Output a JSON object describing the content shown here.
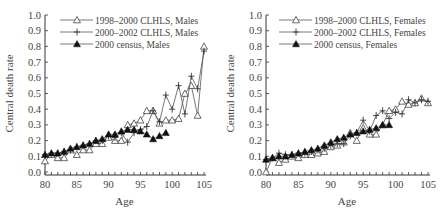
{
  "chart_data": [
    {
      "type": "line",
      "title": "",
      "xlabel": "Age",
      "ylabel": "Central death rate",
      "xlim": [
        80,
        105
      ],
      "ylim": [
        0.0,
        1.0
      ],
      "xticks": [
        "80",
        "85",
        "90",
        "95",
        "100",
        "105"
      ],
      "yticks": [
        "0.0",
        "0.1",
        "0.2",
        "0.3",
        "0.4",
        "0.5",
        "0.6",
        "0.7",
        "0.8",
        "0.9",
        "1.0"
      ],
      "legend_position": "top-left",
      "series": [
        {
          "name": "1998–2000 CLHLS, Males",
          "marker": "open-triangle",
          "x": [
            80,
            81,
            82,
            83,
            84,
            85,
            86,
            87,
            88,
            89,
            90,
            91,
            92,
            93,
            94,
            95,
            96,
            97,
            98,
            99,
            100,
            101,
            102,
            103,
            104,
            105
          ],
          "y": [
            0.07,
            0.11,
            0.09,
            0.09,
            0.14,
            0.11,
            0.14,
            0.14,
            0.18,
            0.18,
            0.22,
            0.2,
            0.2,
            0.3,
            0.31,
            0.33,
            0.39,
            0.39,
            0.31,
            0.33,
            0.33,
            0.34,
            0.5,
            0.55,
            0.36,
            0.8
          ]
        },
        {
          "name": "2000–2002 CLHLS, Males",
          "marker": "plus",
          "x": [
            80,
            81,
            82,
            83,
            84,
            85,
            86,
            87,
            88,
            89,
            90,
            91,
            92,
            93,
            94,
            95,
            96,
            97,
            98,
            99,
            100,
            101,
            102,
            103,
            104,
            105
          ],
          "y": [
            0.11,
            0.12,
            0.12,
            0.13,
            0.14,
            0.16,
            0.17,
            0.18,
            0.2,
            0.2,
            0.23,
            0.22,
            0.25,
            0.19,
            0.25,
            0.27,
            0.29,
            0.39,
            0.32,
            0.49,
            0.4,
            0.55,
            0.37,
            0.61,
            0.53,
            0.77
          ]
        },
        {
          "name": "2000 census, Males",
          "marker": "filled-triangle",
          "x": [
            80,
            81,
            82,
            83,
            84,
            85,
            86,
            87,
            88,
            89,
            90,
            91,
            92,
            93,
            94,
            95,
            96,
            97,
            98,
            99
          ],
          "y": [
            0.11,
            0.12,
            0.12,
            0.13,
            0.15,
            0.16,
            0.17,
            0.18,
            0.2,
            0.21,
            0.24,
            0.24,
            0.26,
            0.27,
            0.27,
            0.26,
            0.24,
            0.21,
            0.23,
            0.25
          ]
        }
      ]
    },
    {
      "type": "line",
      "title": "",
      "xlabel": "Age",
      "ylabel": "Central death rate",
      "xlim": [
        80,
        105
      ],
      "ylim": [
        0.0,
        1.0
      ],
      "xticks": [
        "80",
        "85",
        "90",
        "95",
        "100",
        "105"
      ],
      "yticks": [
        "0.0",
        "0.1",
        "0.2",
        "0.3",
        "0.4",
        "0.5",
        "0.6",
        "0.7",
        "0.8",
        "0.9",
        "1.0"
      ],
      "legend_position": "top-left",
      "series": [
        {
          "name": "1998–2000 CLHLS, Females",
          "marker": "open-triangle",
          "x": [
            80,
            81,
            82,
            83,
            84,
            85,
            86,
            87,
            88,
            89,
            90,
            91,
            92,
            93,
            94,
            95,
            96,
            97,
            98,
            99,
            100,
            101,
            102,
            103,
            104,
            105
          ],
          "y": [
            0.0,
            0.09,
            0.06,
            0.08,
            0.1,
            0.09,
            0.11,
            0.11,
            0.12,
            0.13,
            0.16,
            0.17,
            0.19,
            0.25,
            0.2,
            0.28,
            0.24,
            0.24,
            0.3,
            0.39,
            0.4,
            0.45,
            0.43,
            0.44,
            0.47,
            0.44
          ]
        },
        {
          "name": "2000–2002 CLHLS, Females",
          "marker": "plus",
          "x": [
            80,
            81,
            82,
            83,
            84,
            85,
            86,
            87,
            88,
            89,
            90,
            91,
            92,
            93,
            94,
            95,
            96,
            97,
            98,
            99,
            100,
            101,
            102,
            103,
            104,
            105
          ],
          "y": [
            0.08,
            0.09,
            0.12,
            0.11,
            0.11,
            0.12,
            0.12,
            0.13,
            0.14,
            0.15,
            0.17,
            0.18,
            0.18,
            0.23,
            0.25,
            0.33,
            0.26,
            0.36,
            0.39,
            0.34,
            0.38,
            0.37,
            0.46,
            0.44,
            0.46,
            0.45
          ]
        },
        {
          "name": "2000 census, Females",
          "marker": "filled-triangle",
          "x": [
            80,
            81,
            82,
            83,
            84,
            85,
            86,
            87,
            88,
            89,
            90,
            91,
            92,
            93,
            94,
            95,
            96,
            97,
            98,
            99
          ],
          "y": [
            0.08,
            0.09,
            0.1,
            0.1,
            0.11,
            0.12,
            0.13,
            0.14,
            0.15,
            0.17,
            0.19,
            0.21,
            0.22,
            0.24,
            0.25,
            0.26,
            0.27,
            0.28,
            0.3,
            0.3
          ]
        }
      ]
    }
  ]
}
